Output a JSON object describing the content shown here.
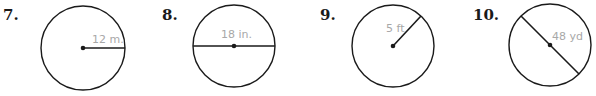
{
  "problems": [
    {
      "number": "7.",
      "measure_label": "12 m.",
      "segment": "radius",
      "cx": 83,
      "cy": 48,
      "r": 42
    },
    {
      "number": "8.",
      "measure_label": "18 in.",
      "segment": "diameter",
      "cx": 234,
      "cy": 46,
      "r": 41
    },
    {
      "number": "9.",
      "measure_label": "5 ft",
      "segment": "radius",
      "cx": 393,
      "cy": 46,
      "r": 41
    },
    {
      "number": "10.",
      "measure_label": "48 yd",
      "segment": "diameter",
      "cx": 550,
      "cy": 45,
      "r": 41
    }
  ],
  "colors": {
    "stroke": "#1a1a1a",
    "label": "#a8a8a8"
  }
}
